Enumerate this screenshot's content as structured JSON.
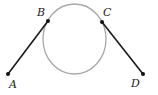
{
  "diagram": {
    "colors": {
      "circle": "#a8a8a8",
      "segment": "#1a1a1a",
      "point": "#111111",
      "label": "#222222"
    },
    "circle": {
      "cx": 74.5,
      "cy": 39,
      "rx": 31.5,
      "ry": 35
    },
    "points": {
      "A": {
        "label": "A",
        "x": 8,
        "y": 74
      },
      "B": {
        "label": "B",
        "x": 48,
        "y": 21
      },
      "C": {
        "label": "C",
        "x": 102,
        "y": 22
      },
      "D": {
        "label": "D",
        "x": 143,
        "y": 74
      }
    },
    "segments": [
      {
        "from": "A",
        "to": "B"
      },
      {
        "from": "C",
        "to": "D"
      }
    ]
  }
}
